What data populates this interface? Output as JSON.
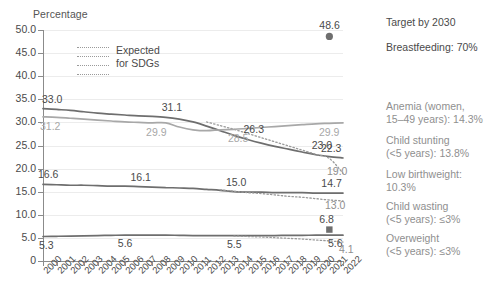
{
  "chart_data": {
    "type": "line",
    "title": "",
    "ylabel": "Percentage",
    "xlabel": "",
    "ylim": [
      0,
      50
    ],
    "ytick_labels": [
      "0",
      "5.0",
      "10.0",
      "15.0",
      "20.0",
      "25.0",
      "30.0",
      "35.0",
      "40.0",
      "45.0",
      "50.0"
    ],
    "ytick_values": [
      0,
      5,
      10,
      15,
      20,
      25,
      30,
      35,
      40,
      45,
      50
    ],
    "grid": true,
    "legend_position": "inside-top-left",
    "x": [
      "2000",
      "2001",
      "2002",
      "2003",
      "2004",
      "2005",
      "2006",
      "2007",
      "2008",
      "2009",
      "2010",
      "2011",
      "2012",
      "2013",
      "2014",
      "2015",
      "2016",
      "2017",
      "2018",
      "2019",
      "2020",
      "2021",
      "2022"
    ],
    "series": [
      {
        "name": "Anemia (women, 15-49 years)",
        "style": "solid",
        "color": "#6e6e6e",
        "values": [
          33.0,
          32.8,
          32.6,
          32.3,
          32.0,
          31.8,
          31.6,
          31.4,
          31.3,
          31.1,
          30.7,
          30.1,
          29.2,
          28.2,
          27.2,
          26.3,
          25.5,
          24.8,
          24.2,
          23.6,
          23.0,
          22.6,
          22.3
        ],
        "labels": [
          {
            "x": "2000",
            "value": 33.0
          },
          {
            "x": "2009",
            "value": 31.1
          },
          {
            "x": "2015",
            "value": 26.3
          },
          {
            "x": "2020",
            "value": 23.0
          },
          {
            "x": "2022",
            "value": 22.3
          }
        ]
      },
      {
        "name": "Anemia expected for SDGs",
        "style": "dotted",
        "color": "#9a9a9a",
        "values": [
          null,
          null,
          null,
          null,
          null,
          null,
          null,
          null,
          null,
          null,
          null,
          null,
          30.1,
          29.3,
          28.5,
          27.6,
          26.7,
          25.8,
          24.9,
          24.0,
          23.1,
          22.2,
          19.0
        ],
        "labels": [
          {
            "x": "2022",
            "value": 19.0
          }
        ]
      },
      {
        "name": "Breastfeeding",
        "style": "solid",
        "color": "#a8a8a8",
        "values": [
          31.2,
          31.1,
          30.9,
          30.7,
          30.5,
          30.3,
          30.1,
          30.0,
          29.9,
          29.9,
          29.0,
          28.4,
          28.2,
          28.4,
          28.5,
          28.7,
          28.9,
          29.1,
          29.3,
          29.5,
          29.7,
          29.8,
          29.9
        ],
        "labels": [
          {
            "x": "2000",
            "value": 31.2
          },
          {
            "x": "2008",
            "value": 29.9
          },
          {
            "x": "2014",
            "value": 28.5
          },
          {
            "x": "2022",
            "value": 29.9
          }
        ]
      },
      {
        "name": "Child stunting (<5 years)",
        "style": "solid",
        "color": "#6e6e6e",
        "values": [
          16.6,
          16.5,
          16.4,
          16.4,
          16.3,
          16.2,
          16.2,
          16.1,
          16.0,
          15.9,
          15.8,
          15.7,
          15.5,
          15.3,
          15.0,
          14.9,
          14.9,
          14.8,
          14.8,
          14.8,
          14.7,
          14.7,
          14.7
        ],
        "labels": [
          {
            "x": "2000",
            "value": 16.6
          },
          {
            "x": "2007",
            "value": 16.1
          },
          {
            "x": "2014",
            "value": 15.0
          },
          {
            "x": "2021",
            "value": 14.7
          }
        ]
      },
      {
        "name": "Child stunting expected for SDGs",
        "style": "dotted",
        "color": "#9a9a9a",
        "values": [
          null,
          null,
          null,
          null,
          null,
          null,
          null,
          null,
          null,
          null,
          null,
          null,
          null,
          15.4,
          15.1,
          14.8,
          14.6,
          14.3,
          14.0,
          13.8,
          13.5,
          13.2,
          13.0
        ],
        "labels": [
          {
            "x": "2022",
            "value": 13.0
          }
        ]
      },
      {
        "name": "Child wasting / low birthweight",
        "style": "solid",
        "color": "#6e6e6e",
        "values": [
          5.3,
          5.35,
          5.4,
          5.45,
          5.5,
          5.55,
          5.6,
          5.6,
          5.6,
          5.6,
          5.55,
          5.5,
          5.5,
          5.5,
          5.5,
          5.5,
          5.5,
          5.5,
          5.55,
          5.55,
          5.6,
          5.6,
          5.6
        ],
        "labels": [
          {
            "x": "2000",
            "value": 5.3
          },
          {
            "x": "2006",
            "value": 5.6
          },
          {
            "x": "2014",
            "value": 5.5
          },
          {
            "x": "2022",
            "value": 5.6
          }
        ]
      },
      {
        "name": "Wasting expected for SDGs",
        "style": "dotted",
        "color": "#9a9a9a",
        "values": [
          null,
          null,
          null,
          null,
          null,
          null,
          null,
          null,
          null,
          null,
          null,
          null,
          null,
          null,
          5.4,
          5.3,
          5.2,
          5.05,
          4.9,
          4.75,
          4.55,
          4.35,
          4.1
        ],
        "labels": [
          {
            "x": "2022",
            "value": 4.1
          }
        ]
      }
    ],
    "markers": [
      {
        "name": "breastfeeding-point",
        "x": "2021",
        "value": 48.6,
        "shape": "circle",
        "color": "#6e6e6e",
        "label": "48.6"
      },
      {
        "name": "overweight-point",
        "x": "2021",
        "value": 6.8,
        "shape": "square",
        "color": "#6e6e6e",
        "label": "6.8"
      }
    ]
  },
  "legend": {
    "line1": "Expected",
    "line2": "for SDGs"
  },
  "side_panel": {
    "heading": "Target by 2030",
    "items": [
      "Breastfeeding: 70%",
      "Anemia (women,\n15–49 years): 14.3%",
      "Child stunting\n(<5 years): 13.8%",
      "Low birthweight:\n10.3%",
      "Child wasting\n(<5 years): ≤3%",
      "Overweight\n(<5 years): ≤3%"
    ],
    "item0": "Breastfeeding: 70%",
    "item1_l1": "Anemia (women,",
    "item1_l2": "15–49 years): 14.3%",
    "item2_l1": "Child stunting",
    "item2_l2": "(<5 years): 13.8%",
    "item3_l1": "Low birthweight:",
    "item3_l2": "10.3%",
    "item4_l1": "Child wasting",
    "item4_l2": "(<5 years): ≤3%",
    "item5_l1": "Overweight",
    "item5_l2": "(<5 years): ≤3%"
  },
  "axis": {
    "y_title": "Percentage"
  },
  "colors": {
    "dark_line": "#6e6e6e",
    "light_line": "#a8a8a8",
    "dotted_line": "#9a9a9a",
    "grid": "#ececec",
    "axis": "#8b8b8b",
    "text": "#4a4a4a",
    "muted_text": "#8f8f8f"
  }
}
